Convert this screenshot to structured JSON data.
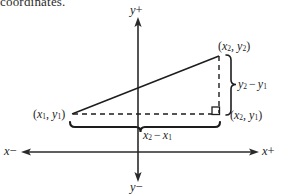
{
  "figure": {
    "kind": "coordinate-plane-distance-formula-diagram",
    "clipped_text_above": "coordinates.",
    "axes": {
      "y_positive_label": "y+",
      "y_negative_label": "y−",
      "x_negative_label": "x−",
      "x_positive_label": "x+",
      "origin": {
        "x": 138,
        "y": 152
      },
      "y_axis_top": 18,
      "y_axis_bottom": 178,
      "x_axis_left": 22,
      "x_axis_right": 258
    },
    "points": {
      "p1": {
        "label": "(x₁, y₁)",
        "x_var": "x",
        "x_sub": "1",
        "y_var": "y",
        "y_sub": "1",
        "px": 72,
        "py": 114
      },
      "p2": {
        "label": "(x₂, y₂)",
        "x_var": "x",
        "x_sub": "2",
        "y_var": "y",
        "y_sub": "2",
        "px": 218,
        "py": 56
      },
      "p21": {
        "label": "(x₂, y₁)",
        "x_var": "x",
        "x_sub": "2",
        "y_var": "y",
        "y_sub": "1",
        "px": 218,
        "py": 114
      }
    },
    "legs": {
      "vertical_label": "y₂ − y₁",
      "vertical_numer_var": "y",
      "vertical_numer_sub": "2",
      "vertical_denom_var": "y",
      "vertical_denom_sub": "1",
      "horizontal_label": "x₂ − x₁",
      "horizontal_numer_var": "x",
      "horizontal_numer_sub": "2",
      "horizontal_denom_var": "x",
      "horizontal_denom_sub": "1",
      "minus_sign": "−"
    },
    "markers": {
      "right_angle_square": "right-angle-marker",
      "hypotenuse_style": "solid",
      "leg_style": "dashed",
      "brace_horizontal": "curly-brace-down",
      "brace_vertical": "curly-brace-right"
    },
    "colors": {
      "ink": "#1d1d1d",
      "background": "#ffffff",
      "axis": "#2a2a2a"
    }
  }
}
